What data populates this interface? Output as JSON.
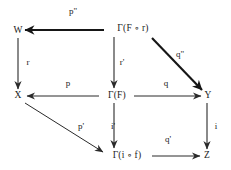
{
  "diagram": {
    "canvas": {
      "width": 231,
      "height": 170,
      "background": "#ffffff",
      "ink": "#1b1b1b"
    },
    "nodes": [
      {
        "id": "W",
        "label": "W",
        "x": 18,
        "y": 31
      },
      {
        "id": "GFr",
        "label": "Γ(F ∘ r)",
        "x": 133,
        "y": 29
      },
      {
        "id": "X",
        "label": "X",
        "x": 18,
        "y": 96
      },
      {
        "id": "GF",
        "label": "Γ(F)",
        "x": 117,
        "y": 96
      },
      {
        "id": "Y",
        "label": "Y",
        "x": 208,
        "y": 96
      },
      {
        "id": "Gif",
        "label": "Γ(i ∘ f)",
        "x": 127,
        "y": 156
      },
      {
        "id": "Z",
        "label": "Z",
        "x": 207,
        "y": 156
      }
    ],
    "edges": [
      {
        "id": "p2",
        "label": "p\"",
        "from": "GFr",
        "to": "W",
        "label_x": 73,
        "label_y": 11,
        "weight": "bold"
      },
      {
        "id": "q2",
        "label": "q\"",
        "from": "GFr",
        "to": "Y",
        "label_x": 180,
        "label_y": 54,
        "weight": "bold"
      },
      {
        "id": "r",
        "label": "r",
        "from": "W",
        "to": "X",
        "label_x": 28,
        "label_y": 62,
        "weight": "normal"
      },
      {
        "id": "rp",
        "label": "r'",
        "from": "GFr",
        "to": "GF",
        "label_x": 122,
        "label_y": 62,
        "weight": "normal"
      },
      {
        "id": "p",
        "label": "p",
        "from": "GF",
        "to": "X",
        "label_x": 68,
        "label_y": 83,
        "weight": "normal"
      },
      {
        "id": "q",
        "label": "q",
        "from": "GF",
        "to": "Y",
        "label_x": 166,
        "label_y": 83,
        "weight": "normal"
      },
      {
        "id": "pp",
        "label": "p'",
        "from": "X",
        "to": "Gif",
        "label_x": 81,
        "label_y": 126,
        "weight": "normal"
      },
      {
        "id": "ip",
        "label": "i'",
        "from": "GF",
        "to": "Gif",
        "label_x": 113,
        "label_y": 126,
        "weight": "normal"
      },
      {
        "id": "qp",
        "label": "q'",
        "from": "Gif",
        "to": "Z",
        "label_x": 168,
        "label_y": 139,
        "weight": "normal"
      },
      {
        "id": "i",
        "label": "i",
        "from": "Y",
        "to": "Z",
        "label_x": 216,
        "label_y": 126,
        "weight": "normal"
      }
    ]
  }
}
